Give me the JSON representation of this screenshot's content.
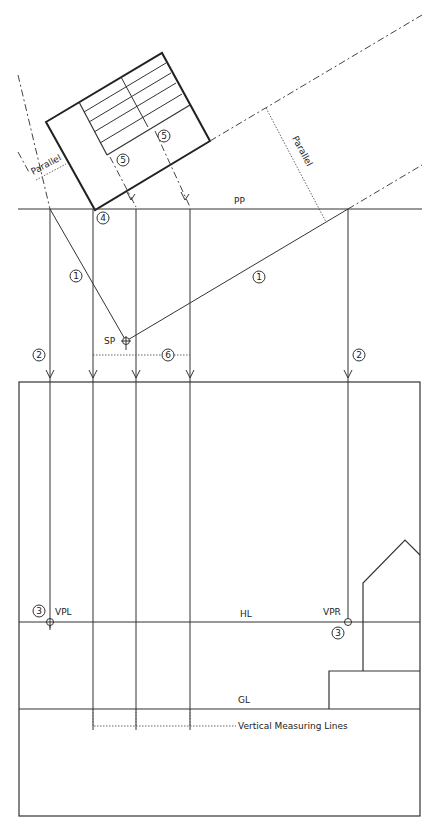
{
  "diagram": {
    "labels": {
      "picture_plane": "PP",
      "station_point": "SP",
      "horizon_line": "HL",
      "ground_line": "GL",
      "vanishing_point_left": "VPL",
      "vanishing_point_right": "VPR",
      "parallel_left": "Parallel",
      "parallel_right": "Parallel",
      "vertical_measuring_lines": "Vertical Measuring Lines"
    },
    "step_markers": {
      "step1_left": "1",
      "step1_right": "1",
      "step2_left": "2",
      "step2_right": "2",
      "step3_left": "3",
      "step3_right": "3",
      "step4": "4",
      "step5_a": "5",
      "step5_b": "5",
      "step6": "6"
    },
    "colors": {
      "ink": "#222222",
      "background": "#ffffff"
    }
  }
}
